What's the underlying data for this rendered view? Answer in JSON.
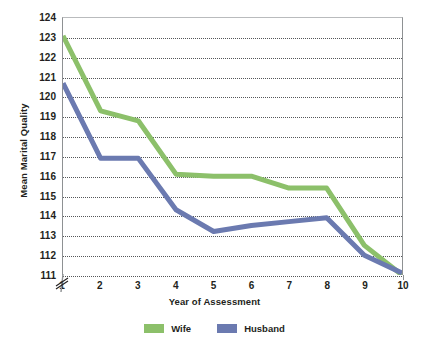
{
  "chart_data": {
    "type": "line",
    "title": "",
    "xlabel": "Year of Assessment",
    "ylabel": "Mean Marital Quality",
    "categories": [
      1,
      2,
      3,
      4,
      5,
      6,
      7,
      8,
      9,
      10
    ],
    "x": [
      1,
      2,
      3,
      4,
      5,
      6,
      7,
      8,
      9,
      10
    ],
    "xlim": [
      1,
      10
    ],
    "ylim": [
      111,
      124
    ],
    "y_ticks": [
      111,
      112,
      113,
      114,
      115,
      116,
      117,
      118,
      119,
      120,
      121,
      122,
      123,
      124
    ],
    "x_ticks": [
      1,
      2,
      3,
      4,
      5,
      6,
      7,
      8,
      9,
      10
    ],
    "grid": "horizontal-dotted",
    "axis_break": true,
    "legend_position": "bottom",
    "series": [
      {
        "name": "Wife",
        "color": "#8cc06a",
        "values": [
          123.1,
          119.3,
          118.8,
          116.1,
          116.0,
          116.0,
          115.4,
          115.4,
          112.5,
          111.0
        ]
      },
      {
        "name": "Husband",
        "color": "#6b7ab0",
        "values": [
          120.7,
          116.9,
          116.9,
          114.3,
          113.2,
          113.5,
          113.7,
          113.9,
          112.0,
          111.1
        ]
      }
    ]
  },
  "axes": {
    "y_title": "Mean Marital Quality",
    "x_title": "Year of Assessment"
  },
  "legend": {
    "items": [
      {
        "label": "Wife",
        "color": "#8cc06a"
      },
      {
        "label": "Husband",
        "color": "#6b7ab0"
      }
    ]
  }
}
